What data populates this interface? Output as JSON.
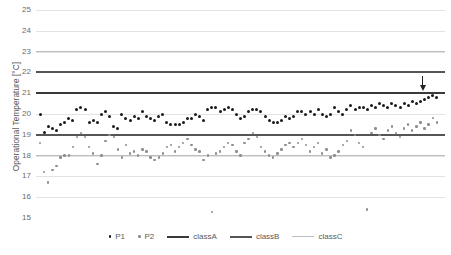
{
  "chart_data": {
    "type": "scatter",
    "title": "",
    "xlabel": "",
    "ylabel": "Operational Temperature [°C]",
    "ylim": [
      15,
      25
    ],
    "xlim": [
      0,
      100
    ],
    "grid": true,
    "yticks": [
      25,
      24,
      23,
      22,
      21,
      20,
      19,
      18,
      17,
      16,
      15
    ],
    "ytick_labels": [
      "25",
      "24",
      "23",
      "22",
      "21",
      "20",
      "19",
      "18",
      "17",
      "16",
      "15"
    ],
    "legend_position": "bottom",
    "legend": [
      "P1",
      "P2",
      "classA",
      "classB",
      "classC"
    ],
    "colors": {
      "P1": "#1a1a1a",
      "P2": "#8e8e8e",
      "classA": "#3a3a3a",
      "classB": "#555555",
      "classC": "#bdbdbd",
      "gridline": "#e3e3e3",
      "axis_text": "#6b6b6b"
    },
    "reference_lines": [
      {
        "name": "classA",
        "values": [
          21.0
        ],
        "color": "#3a3a3a",
        "width": 2
      },
      {
        "name": "classB",
        "values": [
          22.0,
          19.0
        ],
        "color": "#555555",
        "width": 2
      },
      {
        "name": "classC",
        "values": [
          23.0,
          18.0
        ],
        "color": "#bdbdbd",
        "width": 1.6
      }
    ],
    "annotations": [
      {
        "type": "arrow",
        "direction": "down",
        "x": 94.5,
        "y": 21.0,
        "label": ""
      }
    ],
    "series": [
      {
        "name": "P1",
        "marker": "circle",
        "color": "#1a1a1a",
        "x": [
          1,
          2,
          3,
          4,
          5,
          6,
          7,
          8,
          9,
          10,
          11,
          12,
          13,
          14,
          15,
          16,
          17,
          18,
          19,
          20,
          21,
          22,
          23,
          24,
          25,
          26,
          27,
          28,
          29,
          30,
          31,
          32,
          33,
          34,
          35,
          36,
          37,
          38,
          39,
          40,
          41,
          42,
          43,
          44,
          45,
          46,
          47,
          48,
          49,
          50,
          51,
          52,
          53,
          54,
          55,
          56,
          57,
          58,
          59,
          60,
          61,
          62,
          63,
          64,
          65,
          66,
          67,
          68,
          69,
          70,
          71,
          72,
          73,
          74,
          75,
          76,
          77,
          78,
          79,
          80,
          81,
          82,
          83,
          84,
          85,
          86,
          87,
          88,
          89,
          90,
          91,
          92,
          93,
          94,
          95,
          96,
          97,
          98
        ],
        "y": [
          20.0,
          19.1,
          19.4,
          19.3,
          19.2,
          19.5,
          19.6,
          19.8,
          19.7,
          20.2,
          20.3,
          20.2,
          19.6,
          19.7,
          19.6,
          20.0,
          20.1,
          19.9,
          19.4,
          19.3,
          20.0,
          19.8,
          19.7,
          19.9,
          19.8,
          20.1,
          19.9,
          19.8,
          19.7,
          19.9,
          20.0,
          19.6,
          19.5,
          19.5,
          19.5,
          19.6,
          19.8,
          19.8,
          20.0,
          19.9,
          19.7,
          20.2,
          20.3,
          20.3,
          20.1,
          20.2,
          20.3,
          20.2,
          20.0,
          19.8,
          19.9,
          20.1,
          20.2,
          20.2,
          20.1,
          19.9,
          19.7,
          19.6,
          19.6,
          19.7,
          19.9,
          19.8,
          19.9,
          20.1,
          20.1,
          20.0,
          20.1,
          20.0,
          20.2,
          20.0,
          19.9,
          20.0,
          20.3,
          20.1,
          20.0,
          20.2,
          20.4,
          20.2,
          20.3,
          20.3,
          20.2,
          20.4,
          20.3,
          20.5,
          20.4,
          20.3,
          20.5,
          20.4,
          20.3,
          20.5,
          20.4,
          20.6,
          20.5,
          20.6,
          20.7,
          20.8,
          20.9,
          20.8
        ]
      },
      {
        "name": "P2",
        "marker": "circle",
        "color": "#8e8e8e",
        "x": [
          1,
          2,
          3,
          4,
          5,
          6,
          7,
          8,
          9,
          10,
          11,
          12,
          13,
          14,
          15,
          16,
          17,
          18,
          19,
          20,
          21,
          22,
          23,
          24,
          25,
          26,
          27,
          28,
          29,
          30,
          31,
          32,
          33,
          34,
          35,
          36,
          37,
          38,
          39,
          40,
          41,
          42,
          43,
          44,
          45,
          46,
          47,
          48,
          49,
          50,
          51,
          52,
          53,
          54,
          55,
          56,
          57,
          58,
          59,
          60,
          61,
          62,
          63,
          64,
          65,
          66,
          67,
          68,
          69,
          70,
          71,
          72,
          73,
          74,
          75,
          76,
          77,
          78,
          79,
          80,
          81,
          82,
          83,
          84,
          85,
          86,
          87,
          88,
          89,
          90,
          91,
          92,
          93,
          94,
          95,
          96,
          97,
          98
        ],
        "y": [
          18.6,
          17.2,
          16.7,
          17.3,
          17.5,
          17.9,
          18.0,
          18.0,
          18.4,
          18.9,
          19.1,
          18.9,
          18.4,
          18.1,
          17.6,
          18.0,
          18.7,
          19.0,
          18.9,
          18.3,
          17.9,
          18.5,
          18.1,
          18.2,
          18.0,
          18.3,
          18.2,
          17.9,
          17.8,
          17.9,
          18.1,
          18.4,
          18.5,
          18.2,
          18.4,
          18.6,
          18.8,
          18.5,
          18.3,
          18.2,
          17.8,
          18.0,
          15.3,
          18.1,
          18.2,
          18.4,
          18.6,
          18.5,
          18.2,
          18.0,
          18.6,
          18.8,
          19.1,
          18.9,
          18.4,
          18.2,
          18.0,
          17.9,
          18.1,
          18.3,
          18.5,
          18.6,
          18.4,
          18.6,
          18.8,
          18.5,
          18.2,
          18.4,
          18.6,
          18.1,
          18.3,
          17.9,
          18.0,
          18.2,
          18.5,
          18.7,
          19.2,
          19.0,
          18.6,
          18.4,
          15.4,
          19.1,
          19.3,
          19.0,
          18.8,
          19.2,
          19.4,
          19.1,
          18.9,
          19.3,
          19.5,
          19.2,
          19.4,
          19.6,
          19.3,
          19.5,
          19.8,
          19.6
        ]
      }
    ]
  }
}
